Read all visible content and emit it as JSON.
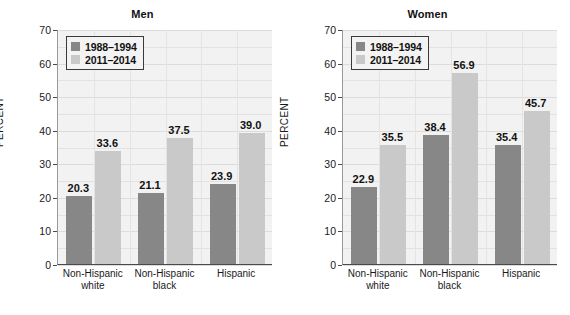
{
  "figure": {
    "panels": [
      {
        "title": "Men",
        "ylabel": "PERCENT",
        "legend": [
          {
            "label": "1988–1994",
            "color": "#878787"
          },
          {
            "label": "2011–2014",
            "color": "#c9c9c9"
          }
        ],
        "categories": [
          {
            "line1": "Non-Hispanic",
            "line2": "white"
          },
          {
            "line1": "Non-Hispanic",
            "line2": "black"
          },
          {
            "line1": "Hispanic",
            "line2": ""
          }
        ],
        "yticks": [
          "0",
          "10",
          "20",
          "30",
          "40",
          "50",
          "60",
          "70"
        ],
        "values": {
          "s0": [
            "20.3",
            "21.1",
            "23.9"
          ],
          "s1": [
            "33.6",
            "37.5",
            "39.0"
          ]
        }
      },
      {
        "title": "Women",
        "ylabel": "PERCENT",
        "legend": [
          {
            "label": "1988–1994",
            "color": "#878787"
          },
          {
            "label": "2011–2014",
            "color": "#c9c9c9"
          }
        ],
        "categories": [
          {
            "line1": "Non-Hispanic",
            "line2": "white"
          },
          {
            "line1": "Non-Hispanic",
            "line2": "black"
          },
          {
            "line1": "Hispanic",
            "line2": ""
          }
        ],
        "yticks": [
          "0",
          "10",
          "20",
          "30",
          "40",
          "50",
          "60",
          "70"
        ],
        "values": {
          "s0": [
            "22.9",
            "38.4",
            "35.4"
          ],
          "s1": [
            "35.5",
            "56.9",
            "45.7"
          ]
        }
      }
    ]
  },
  "chart_data": [
    {
      "type": "bar",
      "title": "Men",
      "xlabel": "",
      "ylabel": "PERCENT",
      "ylim": [
        0,
        70
      ],
      "ytick_step": 10,
      "yticks": [
        0,
        10,
        20,
        30,
        40,
        50,
        60,
        70
      ],
      "grid": true,
      "legend_position": "top-left",
      "categories": [
        "Non-Hispanic white",
        "Non-Hispanic black",
        "Hispanic"
      ],
      "series": [
        {
          "name": "1988–1994",
          "color": "#878787",
          "values": [
            20.3,
            21.1,
            23.9
          ]
        },
        {
          "name": "2011–2014",
          "color": "#c9c9c9",
          "values": [
            33.6,
            37.5,
            39.0
          ]
        }
      ]
    },
    {
      "type": "bar",
      "title": "Women",
      "xlabel": "",
      "ylabel": "PERCENT",
      "ylim": [
        0,
        70
      ],
      "ytick_step": 10,
      "yticks": [
        0,
        10,
        20,
        30,
        40,
        50,
        60,
        70
      ],
      "grid": true,
      "legend_position": "top-left",
      "categories": [
        "Non-Hispanic white",
        "Non-Hispanic black",
        "Hispanic"
      ],
      "series": [
        {
          "name": "1988–1994",
          "color": "#878787",
          "values": [
            22.9,
            38.4,
            35.4
          ]
        },
        {
          "name": "2011–2014",
          "color": "#c9c9c9",
          "values": [
            35.5,
            56.9,
            45.7
          ]
        }
      ]
    }
  ]
}
